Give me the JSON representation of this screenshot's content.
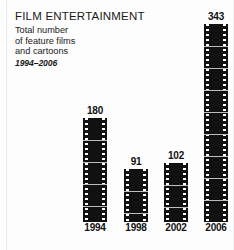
{
  "header": {
    "title": "FILM ENTERTAINMENT",
    "subtitle_lines": [
      "Total number",
      "of feature films",
      "and cartoons"
    ],
    "period": "1994–2006"
  },
  "colors": {
    "bar": "#111111",
    "background": "#fdfdfd",
    "text": "#1a1a1a",
    "frameline": "#bdbdbd",
    "sprocket": "#ffffff"
  },
  "chart_data": {
    "type": "bar",
    "title": "FILM ENTERTAINMENT",
    "subtitle": "Total number of feature films and cartoons 1994–2006",
    "xlabel": "",
    "ylabel": "",
    "categories": [
      "1994",
      "1998",
      "2002",
      "2006"
    ],
    "values": [
      180,
      91,
      102,
      343
    ],
    "value_labels": [
      "180",
      "91",
      "102",
      "343"
    ],
    "ylim": [
      0,
      343
    ],
    "grid": false,
    "legend": false,
    "bar_style": "filmstrip",
    "series": [
      {
        "name": "Total number of feature films and cartoons",
        "values": [
          180,
          91,
          102,
          343
        ]
      }
    ]
  },
  "bars": [
    {
      "year": "1994",
      "value": "180"
    },
    {
      "year": "1998",
      "value": "91"
    },
    {
      "year": "2002",
      "value": "102"
    },
    {
      "year": "2006",
      "value": "343"
    }
  ]
}
